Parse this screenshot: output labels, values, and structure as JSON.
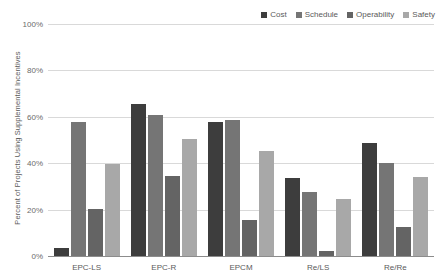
{
  "chart_data": {
    "type": "bar",
    "title": "",
    "subtitle": "",
    "xlabel": "",
    "ylabel": "Percent of Projects Using Supplemental Incentives",
    "categories": [
      "EPC-LS",
      "EPC-R",
      "EPCM",
      "Re/LS",
      "Re/Re"
    ],
    "series": [
      {
        "name": "Cost",
        "color": "#3d3d3d",
        "values": [
          4,
          66,
          58,
          34,
          49
        ]
      },
      {
        "name": "Schedule",
        "color": "#757575",
        "values": [
          58,
          61,
          59,
          28,
          40.5
        ]
      },
      {
        "name": "Operability",
        "color": "#646464",
        "values": [
          20.5,
          35,
          16,
          2.5,
          13
        ]
      },
      {
        "name": "Safety",
        "color": "#a8a8a8",
        "values": [
          40,
          51,
          45.5,
          25,
          34.5
        ]
      }
    ],
    "ylim": [
      0,
      100
    ],
    "y_ticks": [
      0,
      20,
      40,
      60,
      80,
      100
    ],
    "y_tick_labels": [
      "0%",
      "20%",
      "40%",
      "60%",
      "80%",
      "100%"
    ],
    "grid": true,
    "legend_position": "top-right"
  }
}
